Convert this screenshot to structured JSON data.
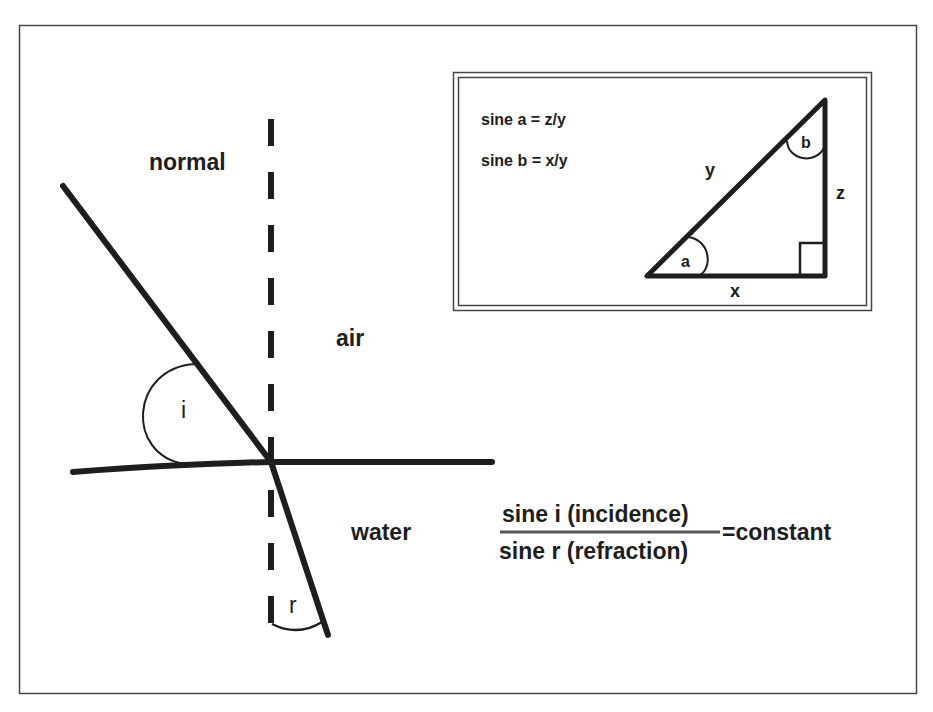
{
  "figure": {
    "labels": {
      "normal": "normal",
      "air": "air",
      "water": "water",
      "angle_incidence": "i",
      "angle_refraction": "r"
    },
    "formula": {
      "numerator": "sine i (incidence)",
      "denominator": "sine r (refraction)",
      "equals": "=constant"
    },
    "inset": {
      "equations": [
        "sine a = z/y",
        "sine b = x/y"
      ],
      "triangle_labels": {
        "hypotenuse": "y",
        "vertical_side": "z",
        "base": "x",
        "angle_a": "a",
        "angle_b": "b"
      }
    },
    "colors": {
      "ink": "#1e1e1e",
      "frame": "#444444",
      "background": "#ffffff"
    }
  }
}
